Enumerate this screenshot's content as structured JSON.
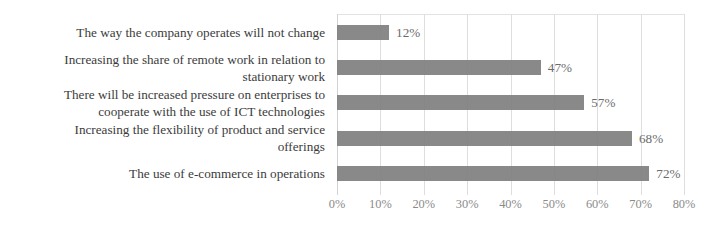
{
  "chart_data": {
    "type": "bar",
    "orientation": "horizontal",
    "title": "",
    "xlabel": "",
    "ylabel": "",
    "xlim": [
      0,
      80
    ],
    "grid": true,
    "legend": "none",
    "categories": [
      "The way the company operates will not change",
      "Increasing the share of remote work in relation to\nstationary work",
      "There will be increased pressure on enterprises to\ncooperate with the use of ICT technologies",
      "Increasing the flexibility of product and service\nofferings",
      "The use of e-commerce in operations"
    ],
    "values": [
      12,
      47,
      57,
      68,
      72
    ],
    "value_labels": [
      "12%",
      "47%",
      "57%",
      "68%",
      "72%"
    ],
    "xticks": [
      0,
      10,
      20,
      30,
      40,
      50,
      60,
      70,
      80
    ],
    "xtick_labels": [
      "0%",
      "10%",
      "20%",
      "30%",
      "40%",
      "50%",
      "60%",
      "70%",
      "80%"
    ],
    "series": [
      {
        "name": "",
        "values": [
          12,
          47,
          57,
          68,
          72
        ]
      }
    ]
  },
  "colors": {
    "bar": "#7f7f7f",
    "gridline": "#dedede",
    "label_text": "#3b3b3b",
    "tick_text": "#8a8a8a",
    "value_text": "#6b6b6b",
    "background": "#ffffff"
  }
}
